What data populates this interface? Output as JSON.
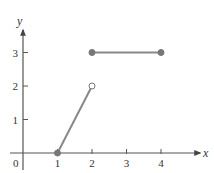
{
  "chart_data": {
    "type": "line",
    "title": "",
    "xlabel": "x",
    "ylabel": "y",
    "xlim": [
      0,
      4.6
    ],
    "ylim": [
      0,
      3.5
    ],
    "x_ticks": [
      "1",
      "2",
      "3",
      "4"
    ],
    "y_ticks": [
      "1",
      "2",
      "3"
    ],
    "origin_label": "0",
    "grid": false,
    "legend": null,
    "series": [
      {
        "name": "segment-1",
        "points": [
          [
            1,
            0
          ],
          [
            2,
            2
          ]
        ],
        "start_marker": "closed",
        "end_marker": "open"
      },
      {
        "name": "segment-2",
        "points": [
          [
            2,
            3
          ],
          [
            4,
            3
          ]
        ],
        "start_marker": "closed",
        "end_marker": "closed"
      }
    ],
    "colors": {
      "axis": "#555555",
      "line": "#888888",
      "marker": "#777777",
      "text": "#333333"
    }
  }
}
